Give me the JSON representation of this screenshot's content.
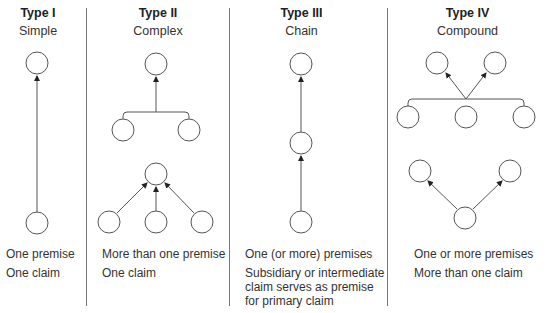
{
  "columns": [
    {
      "title": "Type I",
      "subtitle": "Simple",
      "lines": [
        "One premise",
        "One claim"
      ]
    },
    {
      "title": "Type II",
      "subtitle": "Complex",
      "lines": [
        "More than one premise",
        "One claim"
      ]
    },
    {
      "title": "Type III",
      "subtitle": "Chain",
      "lines": [
        "One (or more) premises",
        "Subsidiary or intermediate",
        "claim serves as premise",
        "for primary claim"
      ]
    },
    {
      "title": "Type IV",
      "subtitle": "Compound",
      "lines": [
        "One or more premises",
        "More than one claim"
      ]
    }
  ],
  "colors": {
    "stroke": "#555555",
    "divider": "#777777",
    "text": "#333333"
  }
}
